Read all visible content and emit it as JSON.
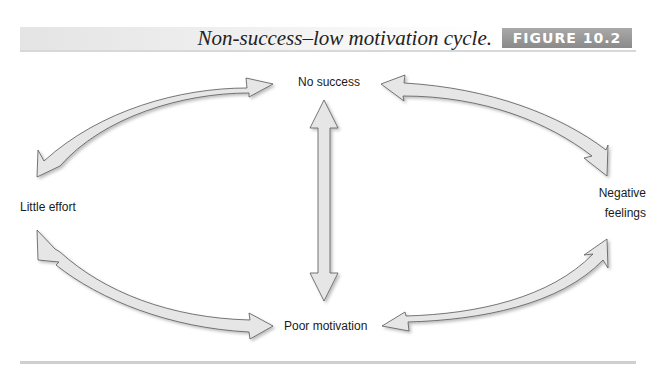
{
  "figure": {
    "title": "Non-success–low motivation cycle.",
    "badge": "FIGURE 10.2",
    "colors": {
      "arrow_fill": "#e6e6e6",
      "arrow_stroke": "#555555",
      "badge_bg": "#999999",
      "header_band": "#e4e4e4"
    }
  },
  "diagram": {
    "nodes": [
      {
        "id": "no-success",
        "label": "No success"
      },
      {
        "id": "little-effort",
        "label": "Little effort"
      },
      {
        "id": "negative-feelings",
        "label_line1": "Negative",
        "label_line2": "feelings"
      },
      {
        "id": "poor-motivation",
        "label": "Poor motivation"
      }
    ],
    "edges": [
      {
        "from": "little-effort",
        "to": "no-success",
        "type": "bidirectional-curved-arrow"
      },
      {
        "from": "no-success",
        "to": "negative-feelings",
        "type": "bidirectional-curved-arrow"
      },
      {
        "from": "negative-feelings",
        "to": "poor-motivation",
        "type": "bidirectional-curved-arrow"
      },
      {
        "from": "poor-motivation",
        "to": "little-effort",
        "type": "bidirectional-curved-arrow"
      },
      {
        "from": "no-success",
        "to": "poor-motivation",
        "type": "bidirectional-straight-arrow"
      }
    ]
  }
}
